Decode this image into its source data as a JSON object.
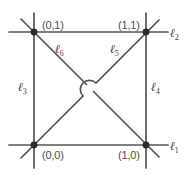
{
  "figure": {
    "stroke_color": "#555555",
    "node_color": "#2b2b2b",
    "background_color": "#ffffff",
    "label_color": "#4f4f4f"
  },
  "points": [
    {
      "name": "top-left",
      "label": "(0,1)",
      "x": 0,
      "y": 1
    },
    {
      "name": "top-right",
      "label": "(1,1)",
      "x": 1,
      "y": 1
    },
    {
      "name": "bottom-left",
      "label": "(0,0)",
      "x": 0,
      "y": 0
    },
    {
      "name": "bottom-right",
      "label": "(1,0)",
      "x": 1,
      "y": 0
    }
  ],
  "lines": [
    {
      "id": "l1",
      "ell": "ℓ",
      "sub": "1",
      "role": "bottom-horizontal"
    },
    {
      "id": "l2",
      "ell": "ℓ",
      "sub": "2",
      "role": "top-horizontal"
    },
    {
      "id": "l3",
      "ell": "ℓ",
      "sub": "3",
      "role": "left-vertical"
    },
    {
      "id": "l4",
      "ell": "ℓ",
      "sub": "4",
      "role": "right-vertical"
    },
    {
      "id": "l5",
      "ell": "ℓ",
      "sub": "5",
      "role": "rising-diagonal"
    },
    {
      "id": "l6",
      "ell": "ℓ",
      "sub": "6",
      "role": "falling-diagonal"
    }
  ],
  "crossing": {
    "name": "center-hop",
    "description": "rising diagonal hops over falling diagonal"
  }
}
